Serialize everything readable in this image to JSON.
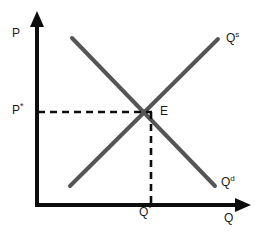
{
  "diagram": {
    "type": "supply-demand",
    "colors": {
      "axis": "#0d0d0d",
      "curve": "#555555",
      "dashed": "#0d0d0d",
      "text": "#1a1a1a",
      "background": "#ffffff"
    },
    "axes": {
      "y": {
        "label": "P",
        "label_full": "Price",
        "origin": [
          37,
          205
        ],
        "tip": [
          37,
          12
        ]
      },
      "x": {
        "label": "Q",
        "label_full": "Quantity",
        "origin": [
          37,
          205
        ],
        "tip": [
          250,
          205
        ]
      }
    },
    "curves": [
      {
        "name": "supply",
        "label_base": "Q",
        "label_sup": "s",
        "from": [
          70,
          186
        ],
        "to": [
          218,
          39
        ]
      },
      {
        "name": "demand",
        "label_base": "Q",
        "label_sup": "d",
        "from": [
          72,
          38
        ],
        "to": [
          215,
          186
        ]
      }
    ],
    "equilibrium": {
      "label": "E",
      "point": [
        152,
        112
      ],
      "price_label_base": "P",
      "price_label_sup": "*",
      "quantity_label_base": "Q",
      "quantity_label_sup": "*",
      "guide_horizontal": {
        "from": [
          37,
          112
        ],
        "to": [
          152,
          112
        ]
      },
      "guide_vertical": {
        "from": [
          152,
          112
        ],
        "to": [
          152,
          205
        ]
      }
    }
  }
}
